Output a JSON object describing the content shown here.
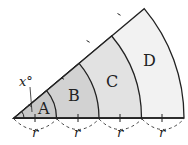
{
  "diagram": {
    "regions": [
      {
        "label": "A",
        "fill": "#c8c8c8"
      },
      {
        "label": "B",
        "fill": "#d2d2d2"
      },
      {
        "label": "C",
        "fill": "#e2e2e2"
      },
      {
        "label": "D",
        "fill": "#f2f2f2"
      }
    ],
    "angle_label": "x°",
    "radius_labels": [
      "r",
      "r",
      "r",
      "r"
    ]
  }
}
